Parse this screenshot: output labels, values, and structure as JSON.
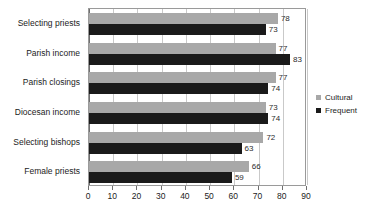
{
  "chart_data": {
    "type": "bar",
    "orientation": "horizontal",
    "title": "",
    "xlabel": "",
    "ylabel": "",
    "xlim": [
      0,
      90
    ],
    "xticks": [
      0,
      10,
      20,
      30,
      40,
      50,
      60,
      70,
      80,
      90
    ],
    "grid": true,
    "legend_position": "right",
    "categories": [
      "Selecting priests",
      "Parish income",
      "Parish closings",
      "Diocesan income",
      "Selecting bishops",
      "Female priests"
    ],
    "series": [
      {
        "name": "Cultural",
        "color": "#a8a8a8",
        "values": [
          78,
          77,
          77,
          73,
          72,
          66
        ]
      },
      {
        "name": "Frequent",
        "color": "#1a1a1a",
        "values": [
          73,
          83,
          74,
          74,
          63,
          59
        ]
      }
    ]
  },
  "axis": {
    "tick_labels": [
      "0",
      "10",
      "20",
      "30",
      "40",
      "50",
      "60",
      "70",
      "80",
      "90"
    ]
  },
  "legend": {
    "items": [
      {
        "label": "Cultural",
        "swatch": "cultural"
      },
      {
        "label": "Frequent",
        "swatch": "frequent"
      }
    ]
  },
  "colors": {
    "cultural": "#a8a8a8",
    "frequent": "#1a1a1a",
    "grid": "#c9c9c9",
    "frame": "#9a9a9a",
    "text": "#1c1c1c"
  }
}
